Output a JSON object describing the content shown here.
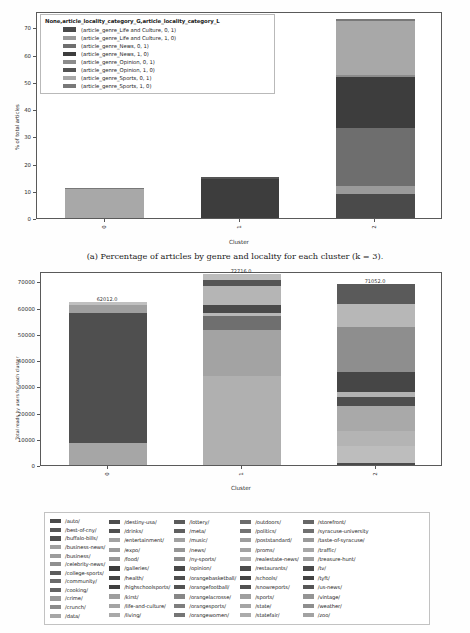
{
  "figure_a": {
    "caption": "(a) Percentage of articles by genre and locality for each cluster (k = 3).",
    "legend_title": "None,article_locality_category_G,article_locality_category_L",
    "legend_items": [
      {
        "label": "(article_genre_Life and Culture, 0, 1)",
        "color": "#4a4a4a"
      },
      {
        "label": "(article_genre_Life and Culture, 1, 0)",
        "color": "#9a9a9a"
      },
      {
        "label": "(article_genre_News, 0, 1)",
        "color": "#6e6e6e"
      },
      {
        "label": "(article_genre_News, 1, 0)",
        "color": "#3d3d3d"
      },
      {
        "label": "(article_genre_Opinion, 0, 1)",
        "color": "#8c8c8c"
      },
      {
        "label": "(article_genre_Opinion, 1, 0)",
        "color": "#545454"
      },
      {
        "label": "(article_genre_Sports, 0, 1)",
        "color": "#a8a8a8"
      },
      {
        "label": "(article_genre_Sports, 1, 0)",
        "color": "#787878"
      }
    ]
  },
  "figure_b": {
    "bar_value_labels": [
      "62012.0",
      "72716.0",
      "71052.0"
    ]
  },
  "url_legend": {
    "columns": [
      [
        {
          "label": "/auto/",
          "color": "#4a4a4a"
        },
        {
          "label": "/best-of-cny/",
          "color": "#555555"
        },
        {
          "label": "/buffalo-bills/",
          "color": "#4f4f4f"
        },
        {
          "label": "/business-news/",
          "color": "#a0a0a0"
        },
        {
          "label": "/business/",
          "color": "#9c9c9c"
        },
        {
          "label": "/celebrity-news/",
          "color": "#8f8f8f"
        },
        {
          "label": "/college-sports/",
          "color": "#5c5c5c"
        },
        {
          "label": "/community/",
          "color": "#6a6a6a"
        },
        {
          "label": "/cooking/",
          "color": "#636363"
        },
        {
          "label": "/crime/",
          "color": "#999999"
        },
        {
          "label": "/crunch/",
          "color": "#8b8b8b"
        },
        {
          "label": "/data/",
          "color": "#a6a6a6"
        }
      ],
      [
        {
          "label": "/destiny-usa/",
          "color": "#4d4d4d"
        },
        {
          "label": "/drinks/",
          "color": "#505050"
        },
        {
          "label": "/entertainment/",
          "color": "#a2a2a2"
        },
        {
          "label": "/expo/",
          "color": "#9b9b9b"
        },
        {
          "label": "/food/",
          "color": "#989898"
        },
        {
          "label": "/galleries/",
          "color": "#3c3c3c"
        },
        {
          "label": "/health/",
          "color": "#444444"
        },
        {
          "label": "/highschoolsports/",
          "color": "#3f3f3f"
        },
        {
          "label": "/kirst/",
          "color": "#9e9e9e"
        },
        {
          "label": "/life-and-culture/",
          "color": "#a4a4a4"
        },
        {
          "label": "/living/",
          "color": "#a9a9a9"
        }
      ],
      [
        {
          "label": "/lottery/",
          "color": "#5b5b5b"
        },
        {
          "label": "/meta/",
          "color": "#606060"
        },
        {
          "label": "/music/",
          "color": "#a1a1a1"
        },
        {
          "label": "/news/",
          "color": "#969696"
        },
        {
          "label": "/ny-sports/",
          "color": "#8d8d8d"
        },
        {
          "label": "/opinion/",
          "color": "#484848"
        },
        {
          "label": "/orangebasketball/",
          "color": "#4e4e4e"
        },
        {
          "label": "/orangefootball/",
          "color": "#525252"
        },
        {
          "label": "/orangelacrosse/",
          "color": "#878787"
        },
        {
          "label": "/orangesports/",
          "color": "#7e7e7e"
        },
        {
          "label": "/orangewomen/",
          "color": "#757575"
        }
      ],
      [
        {
          "label": "/outdoors/",
          "color": "#6b6b6b"
        },
        {
          "label": "/politics/",
          "color": "#727272"
        },
        {
          "label": "/poststandard/",
          "color": "#9d9d9d"
        },
        {
          "label": "/proms/",
          "color": "#a3a3a3"
        },
        {
          "label": "/realestate-news/",
          "color": "#adadad"
        },
        {
          "label": "/restaurants/",
          "color": "#4c4c4c"
        },
        {
          "label": "/schools/",
          "color": "#454545"
        },
        {
          "label": "/snowreports/",
          "color": "#515151"
        },
        {
          "label": "/sports/",
          "color": "#9f9f9f"
        },
        {
          "label": "/state/",
          "color": "#a5a5a5"
        },
        {
          "label": "/statefair/",
          "color": "#ababab"
        }
      ],
      [
        {
          "label": "/storefront/",
          "color": "#666666"
        },
        {
          "label": "/syracuse-university",
          "color": "#707070"
        },
        {
          "label": "/taste-of-syracuse/",
          "color": "#9a9a9a"
        },
        {
          "label": "/traffic/",
          "color": "#a7a7a7"
        },
        {
          "label": "/treasure-hunt/",
          "color": "#a0a0a0"
        },
        {
          "label": "/tv/",
          "color": "#4b4b4b"
        },
        {
          "label": "/tyft/",
          "color": "#434343"
        },
        {
          "label": "/us-news/",
          "color": "#565656"
        },
        {
          "label": "/vintage/",
          "color": "#949494"
        },
        {
          "label": "/weather/",
          "color": "#8e8e8e"
        },
        {
          "label": "/zoo/",
          "color": "#a2a2a2"
        }
      ]
    ]
  },
  "chart_data": [
    {
      "type": "bar",
      "id": "figure-a",
      "title": "",
      "subtitle": "",
      "xlabel": "Cluster",
      "ylabel": "% of total articles",
      "categories": [
        "0",
        "1",
        "2"
      ],
      "ylim": [
        0,
        76
      ],
      "yticks": [
        0,
        10,
        20,
        30,
        40,
        50,
        60,
        70
      ],
      "grid": false,
      "stacked": true,
      "legend_position": "upper-left-inside",
      "series": [
        {
          "name": "(article_genre_Life and Culture, 0, 1)",
          "color": "#4a4a4a",
          "values": [
            0.0,
            0.0,
            9.0
          ]
        },
        {
          "name": "(article_genre_Life and Culture, 1, 0)",
          "color": "#9a9a9a",
          "values": [
            0.0,
            0.0,
            2.8
          ]
        },
        {
          "name": "(article_genre_News, 0, 1)",
          "color": "#6e6e6e",
          "values": [
            0.0,
            0.0,
            21.2
          ]
        },
        {
          "name": "(article_genre_News, 1, 0)",
          "color": "#3d3d3d",
          "values": [
            0.0,
            14.4,
            18.6
          ]
        },
        {
          "name": "(article_genre_Opinion, 0, 1)",
          "color": "#8c8c8c",
          "values": [
            0.0,
            0.0,
            0.8
          ]
        },
        {
          "name": "(article_genre_Opinion, 1, 0)",
          "color": "#545454",
          "values": [
            0.0,
            0.6,
            0.0
          ]
        },
        {
          "name": "(article_genre_Sports, 0, 1)",
          "color": "#a8a8a8",
          "values": [
            10.6,
            0.0,
            19.8
          ]
        },
        {
          "name": "(article_genre_Sports, 1, 0)",
          "color": "#787878",
          "values": [
            0.4,
            0.0,
            1.0
          ]
        }
      ]
    },
    {
      "type": "bar",
      "id": "figure-b",
      "title": "",
      "xlabel": "Cluster",
      "ylabel": "Total reads by users for each cluster",
      "categories": [
        "0",
        "1",
        "2"
      ],
      "ylim": [
        0,
        74000
      ],
      "yticks": [
        0,
        10000,
        20000,
        30000,
        40000,
        50000,
        60000,
        70000
      ],
      "grid": false,
      "stacked": true,
      "totals": [
        62012.0,
        72716.0,
        71052.0
      ],
      "series": [
        {
          "name": "cluster-0-seg-1",
          "color": "#a6a6a6",
          "values": [
            8400,
            0,
            0
          ]
        },
        {
          "name": "cluster-0-seg-2",
          "color": "#4f4f4f",
          "values": [
            49400,
            0,
            0
          ]
        },
        {
          "name": "cluster-0-seg-3",
          "color": "#9f9f9f",
          "values": [
            3400,
            0,
            0
          ]
        },
        {
          "name": "cluster-0-seg-4",
          "color": "#c0c0c0",
          "values": [
            800,
            0,
            0
          ]
        },
        {
          "name": "cluster-1-seg-1",
          "color": "#b0b0b0",
          "values": [
            0,
            34000,
            0
          ]
        },
        {
          "name": "cluster-1-seg-2",
          "color": "#a3a3a3",
          "values": [
            0,
            17600,
            0
          ]
        },
        {
          "name": "cluster-1-seg-3",
          "color": "#6f6f6f",
          "values": [
            0,
            5200,
            0
          ]
        },
        {
          "name": "cluster-1-seg-4",
          "color": "#b8b8b8",
          "values": [
            0,
            1200,
            0
          ]
        },
        {
          "name": "cluster-1-seg-5",
          "color": "#4a4a4a",
          "values": [
            0,
            3000,
            0
          ]
        },
        {
          "name": "cluster-1-seg-6",
          "color": "#b5b5b5",
          "values": [
            0,
            7300,
            0
          ]
        },
        {
          "name": "cluster-1-seg-7",
          "color": "#555555",
          "values": [
            0,
            2200,
            0
          ]
        },
        {
          "name": "cluster-1-seg-8",
          "color": "#bcbcbc",
          "values": [
            0,
            2200,
            0
          ]
        },
        {
          "name": "cluster-2-seg-1",
          "color": "#4b4b4b",
          "values": [
            0,
            0,
            900
          ]
        },
        {
          "name": "cluster-2-seg-2",
          "color": "#bdbdbd",
          "values": [
            0,
            0,
            6200
          ]
        },
        {
          "name": "cluster-2-seg-3",
          "color": "#b4b4b4",
          "values": [
            0,
            0,
            5800
          ]
        },
        {
          "name": "cluster-2-seg-4",
          "color": "#a9a9a9",
          "values": [
            0,
            0,
            9600
          ]
        },
        {
          "name": "cluster-2-seg-5",
          "color": "#4e4e4e",
          "values": [
            0,
            0,
            3400
          ]
        },
        {
          "name": "cluster-2-seg-6",
          "color": "#b2b2b2",
          "values": [
            0,
            0,
            2100
          ]
        },
        {
          "name": "cluster-2-seg-7",
          "color": "#464646",
          "values": [
            0,
            0,
            7600
          ]
        },
        {
          "name": "cluster-2-seg-8",
          "color": "#8e8e8e",
          "values": [
            0,
            0,
            17000
          ]
        },
        {
          "name": "cluster-2-seg-9",
          "color": "#b7b7b7",
          "values": [
            0,
            0,
            8800
          ]
        },
        {
          "name": "cluster-2-seg-10",
          "color": "#5a5a5a",
          "values": [
            0,
            0,
            7700
          ]
        }
      ]
    }
  ]
}
